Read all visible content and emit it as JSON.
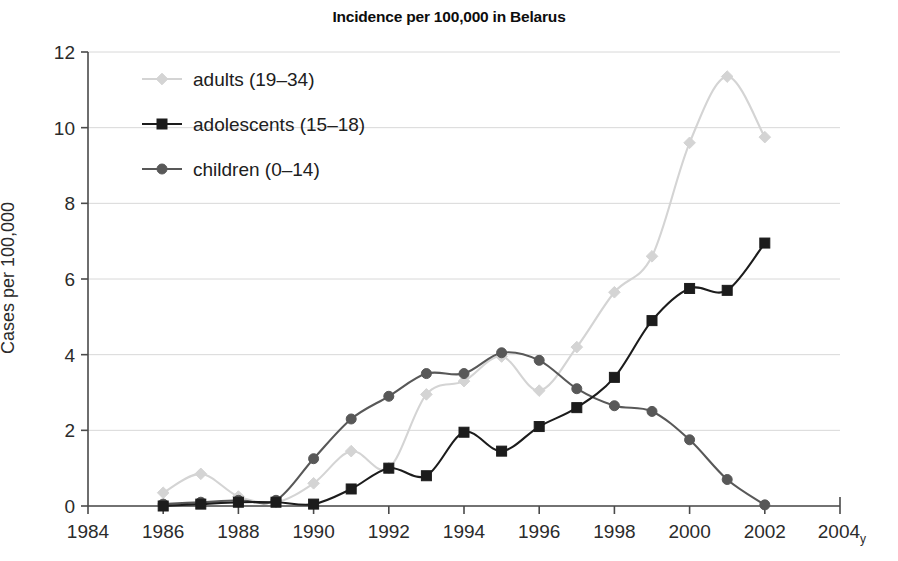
{
  "chart_data": {
    "type": "line",
    "title": "Incidence per 100,000 in Belarus",
    "xlabel": "",
    "ylabel": "Cases per 100,000",
    "x_unit_suffix": "y",
    "xlim": [
      1984,
      2004
    ],
    "ylim": [
      0,
      12
    ],
    "xticks": [
      1984,
      1986,
      1988,
      1990,
      1992,
      1994,
      1996,
      1998,
      2000,
      2002,
      2004
    ],
    "yticks": [
      0,
      2,
      4,
      6,
      8,
      10,
      12
    ],
    "grid": "horizontal",
    "legend_position": "upper-left-inside",
    "smoothing": "spline",
    "x": [
      1986,
      1987,
      1988,
      1989,
      1990,
      1991,
      1992,
      1993,
      1994,
      1995,
      1996,
      1997,
      1998,
      1999,
      2000,
      2001,
      2002
    ],
    "series": [
      {
        "name": "adults (19-34)",
        "label": "adults (19–34)",
        "color": "#d4d4d4",
        "marker": "diamond",
        "values": [
          0.35,
          0.85,
          0.25,
          0.1,
          0.6,
          1.45,
          1.0,
          2.95,
          3.3,
          3.95,
          3.05,
          4.2,
          5.65,
          6.6,
          9.6,
          11.35,
          9.75
        ]
      },
      {
        "name": "adolescents (15-18)",
        "label": "adolescents (15–18)",
        "color": "#1c1c1c",
        "marker": "square",
        "values": [
          0.0,
          0.05,
          0.1,
          0.1,
          0.05,
          0.45,
          1.0,
          0.8,
          1.95,
          1.45,
          2.1,
          2.6,
          3.4,
          4.9,
          5.75,
          5.7,
          6.95
        ]
      },
      {
        "name": "children (0-14)",
        "label": "children (0–14)",
        "color": "#585858",
        "marker": "circle",
        "values": [
          0.05,
          0.1,
          0.15,
          0.15,
          1.25,
          2.3,
          2.9,
          3.5,
          3.5,
          4.05,
          3.85,
          3.1,
          2.65,
          2.5,
          1.75,
          0.7,
          0.03
        ]
      }
    ]
  },
  "legend": {
    "entries": [
      {
        "label": "adults (19–34)"
      },
      {
        "label": "adolescents (15–18)"
      },
      {
        "label": "children (0–14)"
      }
    ]
  },
  "axes": {
    "y_title": "Cases per 100,000",
    "y_tick_labels": [
      "0",
      "2",
      "4",
      "6",
      "8",
      "10",
      "12"
    ],
    "x_tick_labels": [
      "1984",
      "1986",
      "1988",
      "1990",
      "1992",
      "1994",
      "1996",
      "1998",
      "2000",
      "2002",
      "2004"
    ],
    "x_unit": "y"
  }
}
